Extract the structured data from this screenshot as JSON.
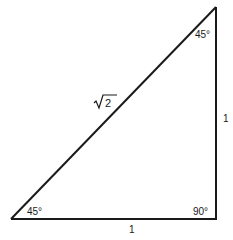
{
  "diagram": {
    "type": "right-triangle",
    "vertices": {
      "bottom_left": {
        "x": 11,
        "y": 219
      },
      "bottom_right": {
        "x": 216,
        "y": 219
      },
      "top_right": {
        "x": 216,
        "y": 7
      }
    },
    "stroke_color": "#1a1a1a",
    "angles": {
      "top_right": "45°",
      "bottom_left": "45°",
      "bottom_right": "90°"
    },
    "sides": {
      "hypotenuse": "2",
      "hypotenuse_radical": "√",
      "vertical": "1",
      "horizontal": "1"
    }
  }
}
